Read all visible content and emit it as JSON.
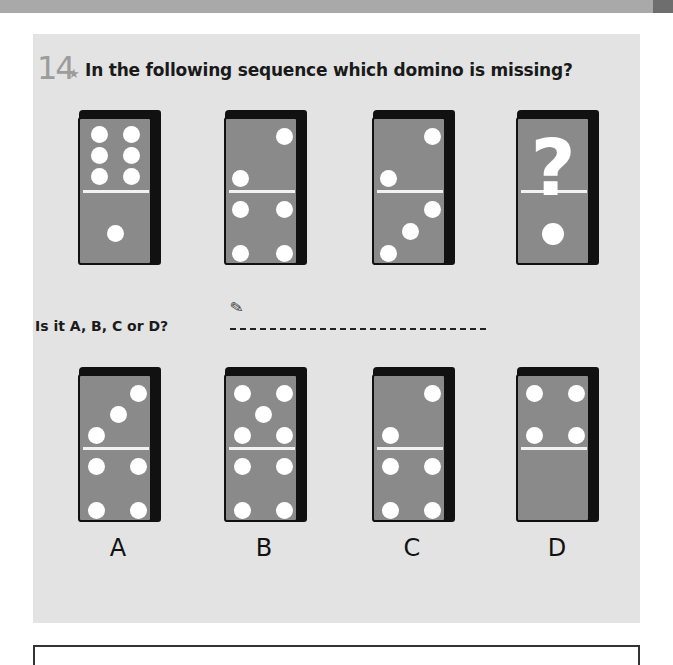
{
  "question": {
    "number": "14",
    "star": "★",
    "text": "In the following sequence which domino is missing?"
  },
  "answer": {
    "prompt": "Is it A, B, C or D?",
    "pencil_icon": "✎"
  },
  "sequence": [
    {
      "id": "seq-1",
      "top": 6,
      "bottom": 1
    },
    {
      "id": "seq-2",
      "top": 2,
      "bottom": 4
    },
    {
      "id": "seq-3",
      "top": 2,
      "bottom": 3
    },
    {
      "id": "seq-4",
      "top": "?",
      "bottom": 1,
      "missing_symbol": "?"
    }
  ],
  "options": [
    {
      "label": "A",
      "top": 3,
      "bottom": 4
    },
    {
      "label": "B",
      "top": 5,
      "bottom": 4
    },
    {
      "label": "C",
      "top": 2,
      "bottom": 4
    },
    {
      "label": "D",
      "top": 4,
      "bottom": 0
    }
  ],
  "colors": {
    "panel": "#e3e3e3",
    "domino_face": "#8a8a8a",
    "domino_edge": "#111111",
    "pip": "#ffffff",
    "number": "#9c9c9c"
  }
}
